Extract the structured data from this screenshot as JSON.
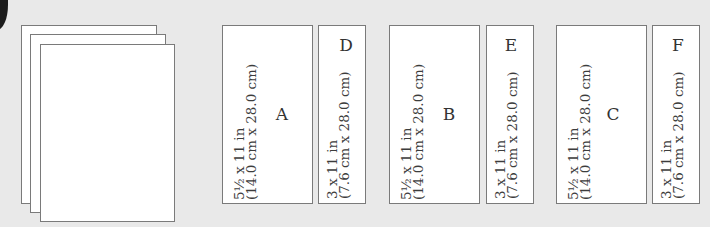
{
  "figure": {
    "stack": {
      "sheet_count": 3
    },
    "layouts": [
      {
        "group": 1,
        "wide_panel": {
          "letter": "A",
          "line1": "5½ x 11 in",
          "line2": "(14.0 cm x 28.0 cm)"
        },
        "narrow_panel": {
          "letter": "D",
          "line1": "3 x 11 in",
          "line2": "(7.6 cm x 28.0 cm)"
        }
      },
      {
        "group": 2,
        "wide_panel": {
          "letter": "B",
          "line1": "5½ x 11 in",
          "line2": "(14.0 cm x 28.0 cm)"
        },
        "narrow_panel": {
          "letter": "E",
          "line1": "3 x 11 in",
          "line2": "(7.6 cm x 28.0 cm)"
        }
      },
      {
        "group": 3,
        "wide_panel": {
          "letter": "C",
          "line1": "5½ x 11 in",
          "line2": "(14.0 cm x 28.0 cm)"
        },
        "narrow_panel": {
          "letter": "F",
          "line1": "3 x 11 in",
          "line2": "(7.6 cm x 28.0 cm)"
        }
      }
    ]
  },
  "colors": {
    "background": "#e9e9e9",
    "paper": "#ffffff",
    "outline": "#7a7a7a",
    "text": "#3a3a3a"
  }
}
